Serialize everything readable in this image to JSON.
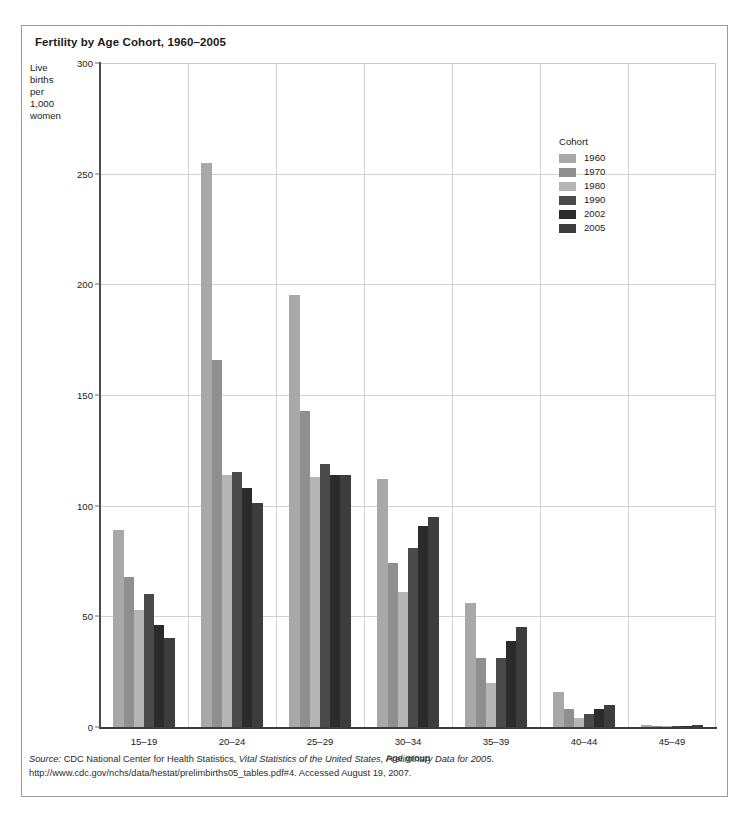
{
  "figure": {
    "title": "Fertility by Age Cohort, 1960–2005",
    "source_label": "Source:",
    "source_text": " CDC National Center for Health Statistics, ",
    "source_italic": "Vital Statistics of the United States, Preliminary Data for 2005",
    "source_tail": ".",
    "source_url_line": "http://www.cdc.gov/nchs/data/hestat/prelimbirths05_tables.pdf#4. Accessed August 19, 2007."
  },
  "y_caption_lines": [
    "Live",
    "births",
    "per",
    "1,000",
    "women"
  ],
  "legend": {
    "title": "Cohort",
    "entries": [
      {
        "label": "1960",
        "color": "#a8a8a8"
      },
      {
        "label": "1970",
        "color": "#8f8f8f"
      },
      {
        "label": "1980",
        "color": "#b5b5b5"
      },
      {
        "label": "1990",
        "color": "#4a4a4a"
      },
      {
        "label": "2002",
        "color": "#2b2b2b"
      },
      {
        "label": "2005",
        "color": "#3d3d3d"
      }
    ]
  },
  "chart_data": {
    "type": "bar",
    "title": "Fertility by Age Cohort, 1960–2005",
    "xlabel": "Age group",
    "ylabel": "Live births per 1,000 women",
    "ylim": [
      0,
      300
    ],
    "yticks": [
      0,
      50,
      100,
      150,
      200,
      250,
      300
    ],
    "grid": true,
    "legend_position": "upper right inside",
    "categories": [
      "15–19",
      "20–24",
      "25–29",
      "30–34",
      "35–39",
      "40–44",
      "45–49"
    ],
    "series": [
      {
        "name": "1960",
        "color": "#a8a8a8",
        "values": [
          89,
          255,
          195,
          112,
          56,
          16,
          1
        ]
      },
      {
        "name": "1970",
        "color": "#8f8f8f",
        "values": [
          68,
          166,
          143,
          74,
          31,
          8,
          0.5
        ]
      },
      {
        "name": "1980",
        "color": "#b5b5b5",
        "values": [
          53,
          114,
          113,
          61,
          20,
          4,
          0.2
        ]
      },
      {
        "name": "1990",
        "color": "#4a4a4a",
        "values": [
          60,
          115,
          119,
          81,
          31,
          6,
          0.3
        ]
      },
      {
        "name": "2002",
        "color": "#2b2b2b",
        "values": [
          46,
          108,
          114,
          91,
          39,
          8,
          0.6
        ]
      },
      {
        "name": "2005",
        "color": "#3d3d3d",
        "values": [
          40,
          101,
          114,
          95,
          45,
          10,
          0.8
        ]
      }
    ]
  }
}
